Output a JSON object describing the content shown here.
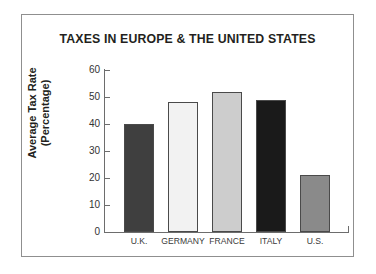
{
  "chart_data": {
    "type": "bar",
    "title": "TAXES IN EUROPE & THE UNITED STATES",
    "xlabel": "",
    "ylabel_line1": "Average Tax Rate",
    "ylabel_line2": "(Percentage)",
    "categories": [
      "U.K.",
      "GERMANY",
      "FRANCE",
      "ITALY",
      "U.S."
    ],
    "values": [
      40,
      48,
      52,
      49,
      21
    ],
    "bar_colors": [
      "#3f3f3f",
      "#f2f2f2",
      "#cdcdcd",
      "#1a1a1a",
      "#8a8a8a"
    ],
    "ylim": [
      0,
      60
    ],
    "ytick_labels": [
      "60",
      "50",
      "40",
      "30",
      "20",
      "10",
      "0"
    ],
    "ytick_values": [
      60,
      50,
      40,
      30,
      20,
      10,
      0
    ],
    "grid": false,
    "legend": "none"
  },
  "style": {
    "frame_color": "#8f8f8f",
    "axis_color": "#6d6d6d",
    "text_color": "#231f20",
    "background": "#ffffff"
  }
}
